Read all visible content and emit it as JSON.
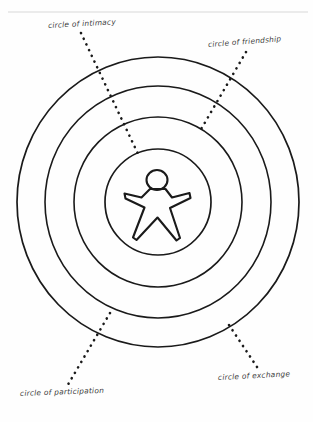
{
  "diagram": {
    "type": "concentric-circles",
    "background_color": "#fefefe",
    "stroke_color": "#1a1a1a",
    "label_color": "#3a3a3a",
    "center": {
      "x": 158,
      "y": 202
    },
    "top_rule": {
      "y": 12,
      "x_start": 8,
      "x_end": 308,
      "color": "#d8d8d8"
    },
    "circles": [
      {
        "name": "circle-of-exchange",
        "radius": 145,
        "order": 4
      },
      {
        "name": "circle-of-participation",
        "radius": 116,
        "order": 3
      },
      {
        "name": "circle-of-friendship",
        "radius": 85,
        "order": 2
      },
      {
        "name": "circle-of-intimacy",
        "radius": 53,
        "order": 1
      }
    ],
    "center_figure": {
      "name": "person-figure",
      "head": {
        "cx": 157,
        "cy": 180,
        "r": 10.5
      },
      "description": "stick person outline"
    },
    "labels": {
      "intimacy": "circle of intimacy",
      "friendship": "circle of friendship",
      "participation": "circle of participation",
      "exchange": "circle of exchange"
    },
    "leaders": {
      "intimacy": {
        "from_x": 81,
        "from_y": 33,
        "to_x": 139,
        "to_y": 156
      },
      "friendship": {
        "from_x": 246,
        "from_y": 52,
        "to_x": 200,
        "to_y": 131
      },
      "participation": {
        "from_x": 110,
        "from_y": 313,
        "to_x": 66,
        "to_y": 388
      },
      "exchange": {
        "from_x": 229,
        "from_y": 325,
        "to_x": 259,
        "to_y": 370
      }
    }
  }
}
